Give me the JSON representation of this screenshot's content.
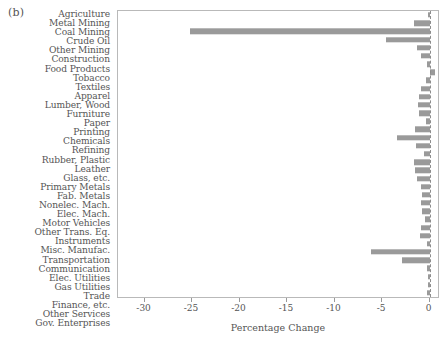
{
  "figure": {
    "panel_label": "(b)",
    "bar_color": "#9a9a9a",
    "frame_color": "#b9b9b9",
    "text_color": "#555555"
  },
  "chart_data": {
    "type": "bar",
    "orientation": "horizontal",
    "title": "",
    "subtitle": "",
    "xlabel": "Percentage Change",
    "ylabel": "",
    "xlim": [
      -32.8,
      1.1
    ],
    "xticks": [
      -30,
      -25,
      -20,
      -15,
      -10,
      -5,
      0
    ],
    "xticklabels": [
      "-30",
      "-25",
      "-20",
      "-15",
      "-10",
      "-5",
      "0"
    ],
    "grid": false,
    "legend": null,
    "zero_reference_line": 0,
    "categories": [
      "Agriculture",
      "Metal Mining",
      "Coal Mining",
      "Crude Oil",
      "Other Mining",
      "Construction",
      "Food Products",
      "Tobacco",
      "Textiles",
      "Apparel",
      "Lumber, Wood",
      "Furniture",
      "Paper",
      "Printing",
      "Chemicals",
      "Refining",
      "Rubber, Plastic",
      "Leather",
      "Glass, etc.",
      "Primary Metals",
      "Fab. Metals",
      "Nonelec. Mach.",
      "Elec. Mach.",
      "Motor Vehicles",
      "Other Trans. Eq.",
      "Instruments",
      "Misc. Manufac.",
      "Transportation",
      "Communication",
      "Elec. Utilities",
      "Gas Utilities",
      "Trade",
      "Finance, etc.",
      "Other Services",
      "Gov. Enterprises"
    ],
    "values": [
      -0.15,
      -1.6,
      -25.2,
      -4.6,
      -1.3,
      -0.9,
      -0.3,
      0.55,
      -0.35,
      -0.9,
      -1.1,
      -1.2,
      -1.1,
      -0.35,
      -1.5,
      -3.4,
      -1.4,
      -0.6,
      -1.6,
      -1.5,
      -1.3,
      -0.9,
      -0.75,
      -0.9,
      -0.8,
      -0.5,
      -0.85,
      -1.0,
      -0.25,
      -6.2,
      -2.9,
      -0.3,
      -0.15,
      -0.2,
      -0.25
    ]
  }
}
